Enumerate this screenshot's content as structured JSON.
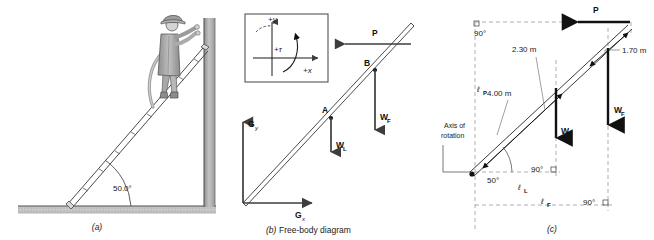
{
  "figure": {
    "panels": [
      {
        "id": "a",
        "caption": "(a)"
      },
      {
        "id": "b",
        "caption": "(b)",
        "caption_text": "Free-body diagram"
      },
      {
        "id": "c",
        "caption": "(c)"
      }
    ]
  },
  "panel_a": {
    "caption": "(a)",
    "angle_label": "50.0°",
    "person": "firefighter-on-ladder",
    "wall": "vertical-wall",
    "ground": "horizontal-ground"
  },
  "panel_b": {
    "caption": "(b)",
    "caption_text": "Free-body diagram",
    "sign_box": {
      "y_axis": "+y",
      "x_axis": "+x",
      "torque": "+τ"
    },
    "points": [
      {
        "label": "A"
      },
      {
        "label": "B"
      }
    ],
    "forces": [
      {
        "symbol": "P",
        "sub": "",
        "dir": "left"
      },
      {
        "symbol": "W",
        "sub": "L",
        "dir": "down"
      },
      {
        "symbol": "W",
        "sub": "F",
        "dir": "down"
      },
      {
        "symbol": "G",
        "sub": "y",
        "dir": "up"
      },
      {
        "symbol": "G",
        "sub": "x",
        "dir": "right"
      }
    ]
  },
  "panel_c": {
    "caption": "(c)",
    "axis_label_line1": "Axis of",
    "axis_label_line2": "rotation",
    "angles": [
      {
        "value": "90°"
      },
      {
        "value": "50°"
      },
      {
        "value": "90°"
      },
      {
        "value": "90°"
      }
    ],
    "dimensions": [
      {
        "value": "2.30 m"
      },
      {
        "value": "4.00 m"
      },
      {
        "value": "1.70 m"
      }
    ],
    "moment_arms": [
      {
        "symbol": "ℓ",
        "sub": "P"
      },
      {
        "symbol": "ℓ",
        "sub": "L"
      },
      {
        "symbol": "ℓ",
        "sub": "F"
      }
    ],
    "forces": [
      {
        "symbol": "P",
        "sub": "",
        "dir": "left"
      },
      {
        "symbol": "W",
        "sub": "L",
        "dir": "down"
      },
      {
        "symbol": "W",
        "sub": "F",
        "dir": "down"
      }
    ]
  },
  "colors": {
    "ink": "#1a1a1a",
    "gray": "#808080",
    "light_gray": "#b3b3b3",
    "arrow": "#595959",
    "dash": "#999999"
  }
}
